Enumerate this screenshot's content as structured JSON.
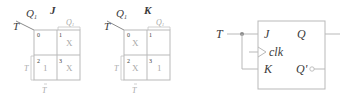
{
  "colors": {
    "grid": "#b9b9b9",
    "text_dark": "#3a3a3a",
    "text_light": "#a8a8a8",
    "bullet": "#8c8c8c"
  },
  "kmap_j": {
    "title": "J",
    "row_var": "T",
    "col_var": "Q",
    "col_var_sub": "1",
    "bracket_top_label": "Q",
    "bracket_top_sub": "1",
    "bracket_left_label": "T",
    "bracket_bottom_label": "T",
    "cells": [
      {
        "index": "0",
        "value": ""
      },
      {
        "index": "1",
        "value": "X"
      },
      {
        "index": "2",
        "value": "1"
      },
      {
        "index": "3",
        "value": "X"
      }
    ]
  },
  "kmap_k": {
    "title": "K",
    "row_var": "T",
    "col_var": "Q",
    "col_var_sub": "1",
    "bracket_top_label": "Q",
    "bracket_top_sub": "1",
    "bracket_left_label": "T",
    "bracket_bottom_label": "T",
    "cells": [
      {
        "index": "0",
        "value": "X"
      },
      {
        "index": "1",
        "value": ""
      },
      {
        "index": "2",
        "value": "X"
      },
      {
        "index": "3",
        "value": "1"
      }
    ]
  },
  "flipflop": {
    "input_label": "T",
    "pin_j": "J",
    "pin_clk": "clk",
    "pin_k": "K",
    "out_q": "Q",
    "out_qbar": "Q'"
  }
}
